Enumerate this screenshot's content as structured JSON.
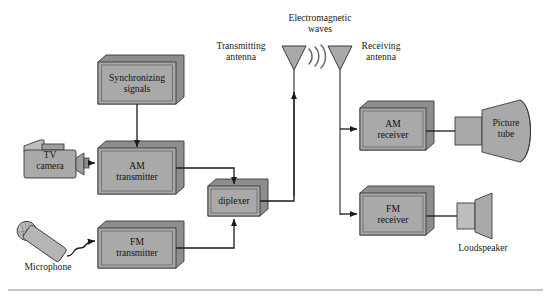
{
  "diagram": {
    "colors": {
      "block_fill": "#a9a9a9",
      "block_side": "#8d8d8d",
      "block_stroke": "#3a3a3a",
      "line": "#1a1a1a",
      "page_bg": "#ffffff",
      "rule": "#8a8a8a"
    },
    "blocks": [
      {
        "name": "sync-signals",
        "label": "Synchronizing\nsignals",
        "x": 98,
        "y": 62,
        "w": 78,
        "h": 42
      },
      {
        "name": "am-transmitter",
        "label": "AM\ntransmitter",
        "x": 98,
        "y": 148,
        "w": 78,
        "h": 46
      },
      {
        "name": "fm-transmitter",
        "label": "FM\ntransmitter",
        "x": 98,
        "y": 228,
        "w": 78,
        "h": 40
      },
      {
        "name": "diplexer",
        "label": "diplexer",
        "x": 208,
        "y": 186,
        "w": 52,
        "h": 30
      },
      {
        "name": "am-receiver",
        "label": "AM\nreceiver",
        "x": 360,
        "y": 108,
        "w": 66,
        "h": 42
      },
      {
        "name": "fm-receiver",
        "label": "FM\nreceiver",
        "x": 360,
        "y": 193,
        "w": 66,
        "h": 42
      }
    ],
    "devices": [
      {
        "name": "tv-camera",
        "label": "TV\ncamera",
        "label_x": 28,
        "label_y": 150
      },
      {
        "name": "microphone",
        "label": "Microphone",
        "label_x": 12,
        "label_y": 268
      },
      {
        "name": "picture-tube",
        "label": "Picture\ntube",
        "label_x": 487,
        "label_y": 120
      },
      {
        "name": "loudspeaker",
        "label": "Loudspeaker",
        "label_x": 452,
        "label_y": 246
      }
    ],
    "annotations": [
      {
        "name": "transmitting-antenna-label",
        "label": "Transmitting\nantenna",
        "x": 210,
        "y": 41,
        "w": 62
      },
      {
        "name": "em-waves-label",
        "label": "Electromagnetic\nwaves",
        "x": 274,
        "y": 13,
        "w": 92
      },
      {
        "name": "receiving-antenna-label",
        "label": "Receiving\nantenna",
        "x": 352,
        "y": 41,
        "w": 58
      }
    ],
    "antennas": [
      {
        "name": "transmitting-antenna",
        "cx": 294,
        "top": 46,
        "half_w": 12,
        "tip_y": 70,
        "mast_bottom": 196
      },
      {
        "name": "receiving-antenna",
        "cx": 340,
        "top": 46,
        "half_w": 12,
        "tip_y": 70,
        "mast_bottom": 215
      }
    ],
    "wave_arcs": {
      "name": "electromagnetic-waves",
      "cx": 309,
      "cy": 55,
      "count": 3
    }
  }
}
